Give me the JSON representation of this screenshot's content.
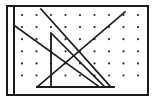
{
  "figure": {
    "canvas": {
      "width": 157,
      "height": 104,
      "background": "#ffffff"
    },
    "frame": {
      "name": "outer-rectangle-border",
      "x": 7,
      "y": 6,
      "width": 141,
      "height": 89,
      "stroke": "#1a1a1a",
      "stroke_width": 2,
      "fill": "#ffffff"
    },
    "axis_line": {
      "name": "left-vertical-axis",
      "x1": 14,
      "y1": 8,
      "x2": 14,
      "y2": 93,
      "stroke": "#1a1a1a",
      "stroke_width": 2
    },
    "dot_grid": {
      "name": "dot-lattice",
      "origin_x": 22,
      "origin_y": 15,
      "spacing_x": 14.5,
      "spacing_y": 12.1,
      "columns": 9,
      "rows": 6,
      "dot_radius": 1.1,
      "dot_color": "#2b2b2b"
    },
    "segments": [
      {
        "name": "segment-upper-left-descending",
        "x1": 15,
        "y1": 26,
        "x2": 98,
        "y2": 86,
        "stroke": "#1a1a1a",
        "stroke_width": 1.6
      },
      {
        "name": "segment-steep-descending-long",
        "x1": 41,
        "y1": 9,
        "x2": 110,
        "y2": 86,
        "stroke": "#1a1a1a",
        "stroke_width": 1.6
      },
      {
        "name": "segment-ascending-diagonal",
        "x1": 37,
        "y1": 87,
        "x2": 125,
        "y2": 12,
        "stroke": "#1a1a1a",
        "stroke_width": 1.6
      },
      {
        "name": "segment-secondary-descending",
        "x1": 51,
        "y1": 33,
        "x2": 104,
        "y2": 86,
        "stroke": "#1a1a1a",
        "stroke_width": 1.6
      }
    ],
    "triangle": {
      "name": "right-triangle",
      "points": "51,33 51,87 110,87",
      "stroke": "#1a1a1a",
      "stroke_width": 1.8,
      "fill": "none",
      "vertices": [
        {
          "name": "vertex-top",
          "x": 51,
          "y": 33
        },
        {
          "name": "vertex-bottom-left",
          "x": 51,
          "y": 87
        },
        {
          "name": "vertex-bottom-right",
          "x": 110,
          "y": 87
        }
      ]
    },
    "baseline": {
      "name": "triangle-baseline",
      "x1": 37,
      "y1": 87,
      "x2": 114,
      "y2": 87,
      "stroke": "#1a1a1a",
      "stroke_width": 1.8
    }
  }
}
